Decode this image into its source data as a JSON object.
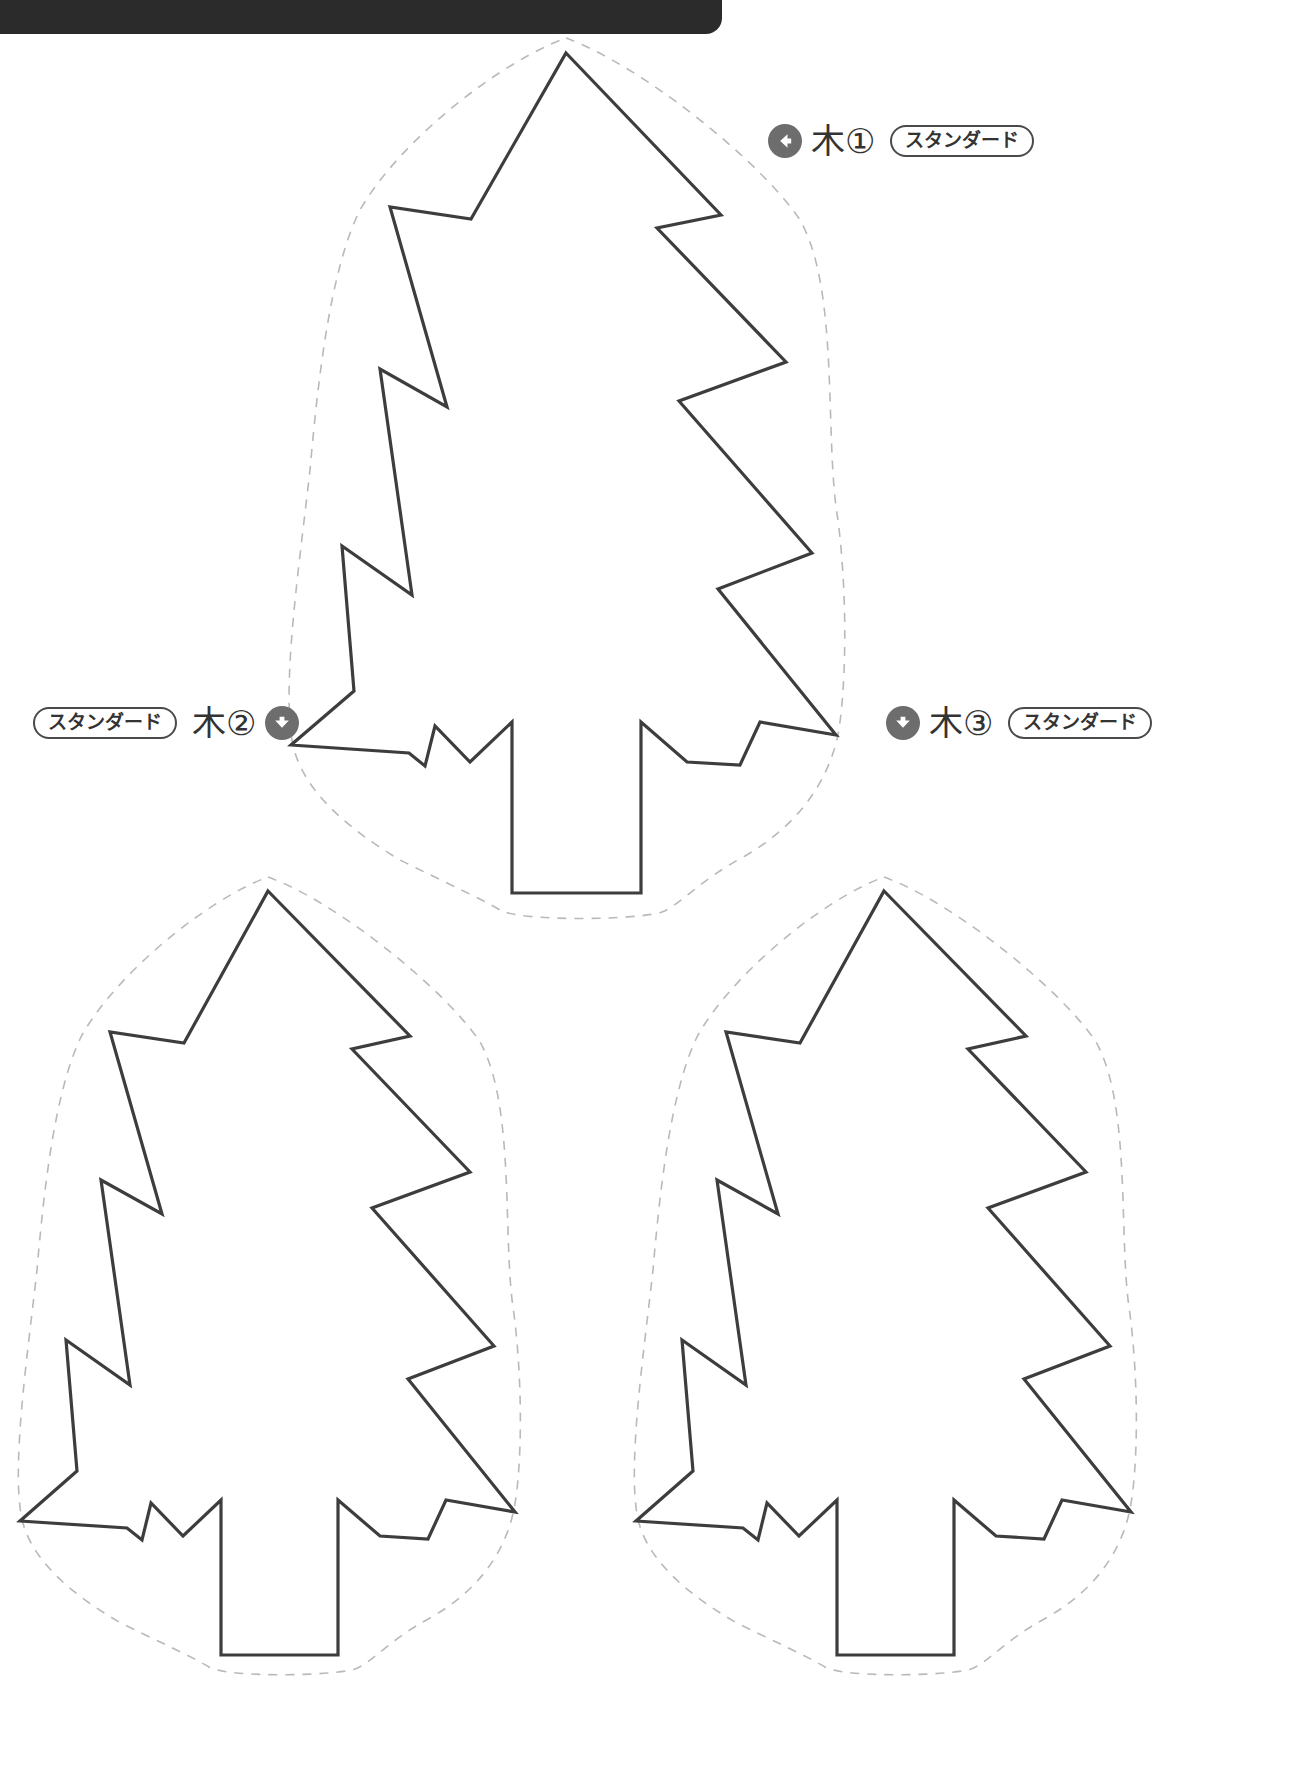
{
  "page": {
    "background_color": "#ffffff",
    "width": 1308,
    "height": 1779
  },
  "topbar": {
    "name": "page-edge-bar",
    "color": "#2b2b2b"
  },
  "labels": [
    {
      "id": "tree-1",
      "arrow": "arrow-left-icon",
      "arrow_direction": "left",
      "title": "木①",
      "badge": "スタンダード",
      "order": "arrow-title-badge"
    },
    {
      "id": "tree-2",
      "arrow": "arrow-down-icon",
      "arrow_direction": "down",
      "title": "木②",
      "badge": "スタンダード",
      "order": "badge-title-arrow"
    },
    {
      "id": "tree-3",
      "arrow": "arrow-down-icon",
      "arrow_direction": "down",
      "title": "木③",
      "badge": "スタンダード",
      "order": "arrow-title-badge"
    }
  ],
  "colors": {
    "outline": "#3d3d3d",
    "cutline": "#b9b9b9",
    "badge_border": "#4a4a4a",
    "icon_bg": "#6d6d6d",
    "icon_fg": "#ffffff",
    "text": "#333333",
    "bar": "#2b2b2b"
  },
  "shapes": {
    "tree_1": {
      "name": "pine-tree-template-1",
      "outline_width": 3.2,
      "cut_dash": "9 8",
      "body": "M 566 53 L 721 215 L 657 228 L 786 362 L 679 401 L 812 553 L 718 589 L 836 735 L 760 722 L 740 765 L 687 762 L 641 722 L 641 893 L 512 893 L 512 722 L 470 762 L 435 726 L 425 766 L 409 753 L 291 745 L 354 691 L 342 546 L 412 595 L 380 369 L 447 407 L 390 207 L 471 219 Z",
      "cut": "M 566 38 C 640 65 760 160 800 220 C 840 290 824 440 838 520 C 848 600 846 690 838 735 C 826 790 790 830 745 856 C 700 880 680 905 662 912 C 640 920 520 922 500 910 C 480 898 440 880 400 860 C 350 830 300 790 292 740 C 282 680 300 560 310 470 C 318 380 330 270 360 210 C 400 140 500 62 566 38 Z"
    },
    "tree_2": {
      "name": "pine-tree-template-2",
      "outline_width": 3.2,
      "cut_dash": "9 8",
      "body": "M 268 891 L 410 1036 L 352 1049 L 470 1172 L 372 1208 L 494 1346 L 408 1379 L 515 1512 L 446 1500 L 428 1539 L 380 1536 L 338 1500 L 338 1655 L 221 1655 L 221 1500 L 183 1536 L 151 1503 L 142 1540 L 127 1528 L 20 1521 L 77 1471 L 66 1340 L 130 1385 L 101 1180 L 162 1214 L 110 1032 L 184 1043 Z",
      "cut": "M 268 877 C 335 901 444 988 480 1042 C 516 1106 502 1242 514 1314 C 523 1386 522 1468 514 1509 C 504 1559 471 1595 430 1618 C 389 1640 372 1663 355 1669 C 335 1676 227 1678 209 1667 C 191 1656 155 1640 119 1622 C 73 1595 28 1559 21 1514 C 12 1460 28 1351 37 1270 C 44 1188 55 1089 82 1035 C 118 972 208 899 268 877 Z"
    },
    "tree_3": {
      "name": "pine-tree-template-3",
      "outline_width": 3.2,
      "cut_dash": "9 8",
      "body": "M 884 891 L 1026 1036 L 968 1049 L 1086 1172 L 988 1208 L 1110 1346 L 1024 1379 L 1131 1512 L 1062 1500 L 1044 1539 L 996 1536 L 954 1500 L 954 1655 L 837 1655 L 837 1500 L 799 1536 L 767 1503 L 758 1540 L 743 1528 L 636 1521 L 693 1471 L 682 1340 L 746 1385 L 717 1180 L 778 1214 L 726 1032 L 800 1043 Z",
      "cut": "M 884 877 C 951 901 1060 988 1096 1042 C 1132 1106 1118 1242 1130 1314 C 1139 1386 1138 1468 1130 1509 C 1120 1559 1087 1595 1046 1618 C 1005 1640 988 1663 971 1669 C 951 1676 843 1678 825 1667 C 807 1656 771 1640 735 1622 C 689 1595 644 1559 637 1514 C 628 1460 644 1351 653 1270 C 660 1188 671 1089 698 1035 C 734 972 824 899 884 877 Z"
    }
  }
}
